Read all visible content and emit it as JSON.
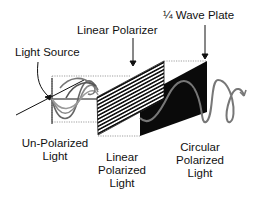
{
  "labels": {
    "wave_plate": "¼ Wave Plate",
    "linear_polarizer": "Linear Polarizer",
    "light_source": "Light Source",
    "unpolarized": [
      "Un-Polarized",
      "Light"
    ],
    "linear_polarized": [
      "Linear",
      "Polarized",
      "Light"
    ],
    "circular_polarized": [
      "Circular",
      "Polarized",
      "Light"
    ]
  },
  "colors": {
    "ink": "#111111",
    "wave_gray": "#666666",
    "plate_black": "#0a0a0a"
  }
}
